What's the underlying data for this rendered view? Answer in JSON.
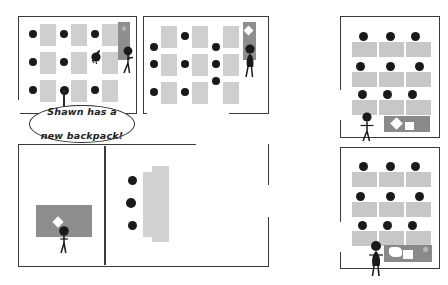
{
  "scene": {
    "title": "Classroom comic panels",
    "speech_bubble": {
      "name": "shawn-backpack-caption",
      "line1": "Shawn has a",
      "line2": "new backpack!"
    },
    "colors": {
      "desk_gray": "#cfcfcf",
      "student_black": "#1a1a1a",
      "door_gray": "#8e8e8e",
      "table_gray": "#8a8a8a",
      "counter_gray": "#d2d2d2",
      "panel_border": "#3a3a3a",
      "background": "#ffffff",
      "item_white": "#ffffff"
    },
    "panels": [
      {
        "id": "panel-top-left",
        "label": "Classroom A",
        "desk_rows": 3,
        "desk_columns": 4,
        "students": 9,
        "has_door": true,
        "door_item": "none",
        "person_at_door": true,
        "extra_figure": "dark-figure-center",
        "has_speech_bubble": true
      },
      {
        "id": "panel-top-middle",
        "label": "Classroom B",
        "desk_rows": 3,
        "desk_columns": 3,
        "students": 9,
        "has_door": true,
        "door_item": "backpack-diamond",
        "person_at_door": true,
        "extra_figure": "none",
        "has_speech_bubble": false
      },
      {
        "id": "panel-top-right",
        "label": "Classroom C",
        "desk_rows": 3,
        "desk_columns": 3,
        "students": 9,
        "has_door": false,
        "person_at_front": true,
        "person_type": "stick-figure-arms-out",
        "front_table": true,
        "table_items": [
          "backpack-diamond",
          "box-square"
        ]
      },
      {
        "id": "panel-bottom-right",
        "label": "Classroom D",
        "desk_rows": 3,
        "desk_columns": 3,
        "students": 9,
        "has_door": false,
        "person_at_front": true,
        "person_type": "stick-figure-skirt",
        "front_table": true,
        "table_items": [
          "paper-blob",
          "box-square",
          "knob"
        ]
      },
      {
        "id": "panel-bottom-left",
        "label": "Hallway and lounge",
        "left_room": {
          "rug": true,
          "person": true,
          "person_item": "backpack-diamond"
        },
        "right_room": {
          "students": 3,
          "counter": true
        }
      }
    ]
  }
}
